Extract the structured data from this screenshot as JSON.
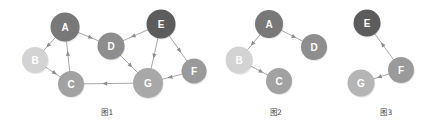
{
  "figures": [
    {
      "id": "fig1",
      "caption": "图1",
      "nodes": [
        {
          "id": "A",
          "label": "A",
          "cx": 65,
          "cy": 27,
          "r": 14.5,
          "fill": "#787878"
        },
        {
          "id": "B",
          "label": "B",
          "cx": 35,
          "cy": 60,
          "r": 13.0,
          "fill": "#d3d3d3"
        },
        {
          "id": "C",
          "label": "C",
          "cx": 71,
          "cy": 84,
          "r": 13.0,
          "fill": "#a2a2a2"
        },
        {
          "id": "D",
          "label": "D",
          "cx": 111,
          "cy": 46,
          "r": 13.5,
          "fill": "#8e8e8e"
        },
        {
          "id": "E",
          "label": "E",
          "cx": 161,
          "cy": 24,
          "r": 14.5,
          "fill": "#5c5c5c"
        },
        {
          "id": "F",
          "label": "F",
          "cx": 194,
          "cy": 71,
          "r": 12.5,
          "fill": "#9a9a9a"
        },
        {
          "id": "G",
          "label": "G",
          "cx": 148,
          "cy": 83,
          "r": 15.0,
          "fill": "#a8a8a8"
        }
      ],
      "edges": [
        {
          "from": "A",
          "to": "B",
          "directed": true
        },
        {
          "from": "B",
          "to": "C",
          "directed": true
        },
        {
          "from": "C",
          "to": "A",
          "directed": true
        },
        {
          "from": "A",
          "to": "D",
          "directed": true
        },
        {
          "from": "E",
          "to": "D",
          "directed": true
        },
        {
          "from": "D",
          "to": "G",
          "directed": true
        },
        {
          "from": "E",
          "to": "G",
          "directed": true
        },
        {
          "from": "E",
          "to": "F",
          "directed": true
        },
        {
          "from": "F",
          "to": "G",
          "directed": true
        },
        {
          "from": "G",
          "to": "C",
          "directed": true
        }
      ]
    },
    {
      "id": "fig2",
      "caption": "图2",
      "nodes": [
        {
          "id": "A",
          "label": "A",
          "cx": 54,
          "cy": 24,
          "r": 14.0,
          "fill": "#787878"
        },
        {
          "id": "B",
          "label": "B",
          "cx": 24,
          "cy": 60,
          "r": 13.5,
          "fill": "#d3d3d3"
        },
        {
          "id": "C",
          "label": "C",
          "cx": 64,
          "cy": 81,
          "r": 13.0,
          "fill": "#a2a2a2"
        },
        {
          "id": "D",
          "label": "D",
          "cx": 99,
          "cy": 47,
          "r": 13.0,
          "fill": "#8e8e8e"
        }
      ],
      "edges": [
        {
          "from": "A",
          "to": "B",
          "directed": true
        },
        {
          "from": "B",
          "to": "C",
          "directed": true
        },
        {
          "from": "A",
          "to": "D",
          "directed": true
        }
      ]
    },
    {
      "id": "fig3",
      "caption": "图3",
      "nodes": [
        {
          "id": "E",
          "label": "E",
          "cx": 30,
          "cy": 23,
          "r": 13.5,
          "fill": "#5c5c5c"
        },
        {
          "id": "F",
          "label": "F",
          "cx": 64,
          "cy": 70,
          "r": 13.0,
          "fill": "#9a9a9a"
        },
        {
          "id": "G",
          "label": "G",
          "cx": 24,
          "cy": 83,
          "r": 13.5,
          "fill": "#b5b5b5"
        }
      ],
      "edges": [
        {
          "from": "F",
          "to": "E",
          "directed": true
        },
        {
          "from": "F",
          "to": "G",
          "directed": true
        }
      ]
    }
  ],
  "style": {
    "edge_color": "#9e9e9e",
    "arrow_color": "#8d8d8d",
    "label_color": "#ffffff",
    "caption_color": "#4a4a4a",
    "background": "#ffffff"
  }
}
